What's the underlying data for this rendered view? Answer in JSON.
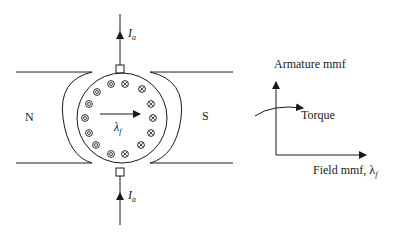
{
  "machine": {
    "north_label": "N",
    "south_label": "S",
    "armature_current_top": {
      "symbol": "I",
      "subscript": "a"
    },
    "armature_current_bottom": {
      "symbol": "I",
      "subscript": "a"
    },
    "field_flux_label": {
      "symbol": "λ",
      "subscript": "f"
    },
    "conductors_dot_count": 7,
    "conductors_cross_count": 7
  },
  "graph": {
    "y_axis_label": "Armature mmf",
    "x_axis_label": "Field mmf, λ",
    "x_axis_subscript": "f",
    "curve_label": "Torque"
  },
  "colors": {
    "stroke": "#1a1a1a",
    "background": "#ffffff"
  }
}
